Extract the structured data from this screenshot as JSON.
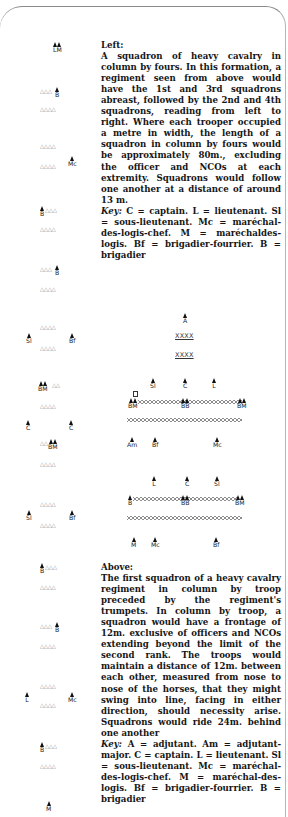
{
  "texts": {
    "left": {
      "heading": "Left:",
      "body": "A squadron of heavy cavalry in column by fours. In this formation, a regiment seen from above would have the 1st and 3rd squadrons abreast, followed by the 2nd and 4th squadrons, reading from left to right. Where each trooper occu­pied a metre in width, the length of a squadron in column by fours would be approximately 80m., excluding the officer and NCOs at each extremity. Squadrons would follow one another at a distance of around 13 m.",
      "key_label": "Key:",
      "key_body": " C = captain. L = lieutenant. Sl = sous-lieutenant. Mc = maré­chal-des-logis-chef. M = maréchal­des-logis. Bf = brigadier-fourrier. B = brigadier"
    },
    "above": {
      "heading": "Above:",
      "body": "The first squadron of a heavy cavalry regiment in column by troop preceded by the regiment's trumpets. In column by troop, a squadron would have a frontage of 12m. exclusive of officers and NCOs extending beyond the limit of the second rank. The troops would maintain a distance of 12m. bet­ween each other, measured from nose to nose of the horses, that they might swing into line, facing in either direction, should necessity arise. Squadrons would ride 24m. behind one another",
      "key_label": "Key:",
      "key_body": " A = adjutant. Am = adjut­ant-major. C = captain. L = lieu­tenant. Sl = sous-lieutenant. Mc = maréchal-des-logis-chef. M = maréchal-des-logis. Bf = brig­adier-fourrier. B = brigadier"
    }
  },
  "left_column": {
    "figures": [
      {
        "label": "LM",
        "x": 53,
        "y": 42,
        "count": 2
      },
      {
        "label": "B",
        "x": 55,
        "y": 87,
        "count": 1
      },
      {
        "label": "Mc",
        "x": 68,
        "y": 156,
        "count": 1
      },
      {
        "label": "B",
        "x": 40,
        "y": 206,
        "count": 1
      },
      {
        "label": "B",
        "x": 55,
        "y": 265,
        "count": 1
      },
      {
        "label": "Sl",
        "x": 26,
        "y": 333,
        "count": 1
      },
      {
        "label": "Bf",
        "x": 69,
        "y": 333,
        "count": 1
      },
      {
        "label": "BM",
        "x": 38,
        "y": 381,
        "count": 2
      },
      {
        "label": "C",
        "x": 26,
        "y": 420,
        "count": 1
      },
      {
        "label": "C",
        "x": 69,
        "y": 420,
        "count": 1
      },
      {
        "label": "BM",
        "x": 48,
        "y": 439,
        "count": 2
      },
      {
        "label": "Sl",
        "x": 26,
        "y": 510,
        "count": 1
      },
      {
        "label": "Bf",
        "x": 69,
        "y": 510,
        "count": 1
      },
      {
        "label": "B",
        "x": 40,
        "y": 563,
        "count": 1
      },
      {
        "label": "B",
        "x": 55,
        "y": 622,
        "count": 1
      },
      {
        "label": "L",
        "x": 25,
        "y": 692,
        "count": 1
      },
      {
        "label": "Mc",
        "x": 68,
        "y": 692,
        "count": 1
      },
      {
        "label": "B",
        "x": 40,
        "y": 742,
        "count": 1
      },
      {
        "label": "M",
        "x": 46,
        "y": 801,
        "count": 1
      }
    ],
    "rows": [
      {
        "x": 40,
        "y": 88,
        "n": 3
      },
      {
        "x": 40,
        "y": 106,
        "n": 4
      },
      {
        "x": 40,
        "y": 143,
        "n": 4
      },
      {
        "x": 40,
        "y": 163,
        "n": 4
      },
      {
        "x": 45,
        "y": 207,
        "n": 3
      },
      {
        "x": 40,
        "y": 226,
        "n": 4
      },
      {
        "x": 40,
        "y": 266,
        "n": 3
      },
      {
        "x": 40,
        "y": 286,
        "n": 4
      },
      {
        "x": 40,
        "y": 324,
        "n": 4
      },
      {
        "x": 40,
        "y": 345,
        "n": 4
      },
      {
        "x": 52,
        "y": 382,
        "n": 2
      },
      {
        "x": 40,
        "y": 403,
        "n": 4
      },
      {
        "x": 40,
        "y": 440,
        "n": 2
      },
      {
        "x": 40,
        "y": 461,
        "n": 4
      },
      {
        "x": 40,
        "y": 501,
        "n": 4
      },
      {
        "x": 40,
        "y": 522,
        "n": 4
      },
      {
        "x": 45,
        "y": 564,
        "n": 3
      },
      {
        "x": 40,
        "y": 584,
        "n": 4
      },
      {
        "x": 40,
        "y": 623,
        "n": 3
      },
      {
        "x": 40,
        "y": 643,
        "n": 4
      },
      {
        "x": 40,
        "y": 683,
        "n": 4
      },
      {
        "x": 40,
        "y": 702,
        "n": 4
      },
      {
        "x": 45,
        "y": 743,
        "n": 3
      },
      {
        "x": 40,
        "y": 763,
        "n": 4
      }
    ]
  },
  "right_diagram": {
    "trumpets": [
      "ΧΧΧΧ",
      "ΧΧΧΧ"
    ],
    "figures": [
      {
        "label": "A",
        "x": 183,
        "y": 313,
        "count": 1
      },
      {
        "label": "Sl",
        "x": 150,
        "y": 378,
        "count": 1
      },
      {
        "label": "C",
        "x": 183,
        "y": 378,
        "count": 1
      },
      {
        "label": "L",
        "x": 212,
        "y": 378,
        "count": 1
      },
      {
        "label": "BM",
        "x": 128,
        "y": 398,
        "count": 2
      },
      {
        "label": "BB",
        "x": 181,
        "y": 398,
        "count": 2
      },
      {
        "label": "BM",
        "x": 237,
        "y": 398,
        "count": 2
      },
      {
        "label": "Am",
        "x": 127,
        "y": 437,
        "count": 1
      },
      {
        "label": "Bf",
        "x": 152,
        "y": 437,
        "count": 1
      },
      {
        "label": "Mc",
        "x": 213,
        "y": 437,
        "count": 1
      },
      {
        "label": "L",
        "x": 152,
        "y": 476,
        "count": 1
      },
      {
        "label": "C",
        "x": 185,
        "y": 476,
        "count": 1
      },
      {
        "label": "Sl",
        "x": 214,
        "y": 476,
        "count": 1
      },
      {
        "label": "B",
        "x": 128,
        "y": 495,
        "count": 1
      },
      {
        "label": "BB",
        "x": 181,
        "y": 495,
        "count": 2
      },
      {
        "label": "BM",
        "x": 235,
        "y": 495,
        "count": 2
      },
      {
        "label": "M",
        "x": 131,
        "y": 537,
        "count": 1
      },
      {
        "label": "Mc",
        "x": 151,
        "y": 537,
        "count": 1
      },
      {
        "label": "Bf",
        "x": 213,
        "y": 537,
        "count": 1
      }
    ]
  }
}
